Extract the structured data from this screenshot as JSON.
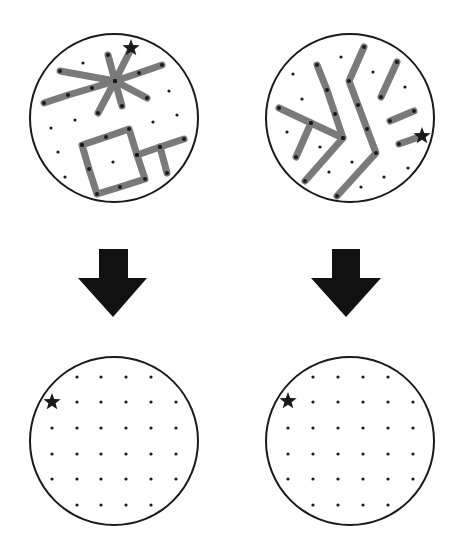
{
  "colors": {
    "outline": "#1a1a1a",
    "segment": "#7a7a7a",
    "dot": "#1a1a1a",
    "arrow": "#111111",
    "star": "#1a1a1a",
    "background": "#ffffff"
  },
  "panels": [
    {
      "id": "top-left",
      "circle": {
        "cx": 114,
        "cy": 118,
        "r": 84
      },
      "star": {
        "x": 131,
        "y": 48
      },
      "segments": [
        [
          [
            44,
            103
          ],
          [
            68,
            95
          ],
          [
            92,
            88
          ],
          [
            115,
            81
          ],
          [
            139,
            73
          ],
          [
            162,
            65
          ]
        ],
        [
          [
            60,
            71
          ],
          [
            115,
            81
          ],
          [
            147,
            98
          ]
        ],
        [
          [
            108,
            55
          ],
          [
            115,
            81
          ],
          [
            122,
            106
          ]
        ],
        [
          [
            131,
            49
          ],
          [
            115,
            81
          ],
          [
            98,
            113
          ]
        ],
        [
          [
            82,
            145
          ],
          [
            106,
            137
          ],
          [
            129,
            129
          ],
          [
            137,
            155
          ],
          [
            145,
            179
          ],
          [
            120,
            187
          ],
          [
            97,
            194
          ],
          [
            89,
            169
          ],
          [
            82,
            145
          ]
        ],
        [
          [
            137,
            155
          ],
          [
            160,
            147
          ],
          [
            184,
            139
          ]
        ],
        [
          [
            160,
            147
          ],
          [
            167,
            173
          ]
        ]
      ],
      "dots": [
        [
          83,
          63
        ],
        [
          169,
          91
        ],
        [
          75,
          120
        ],
        [
          51,
          128
        ],
        [
          153,
          122
        ],
        [
          177,
          115
        ],
        [
          58,
          152
        ],
        [
          65,
          177
        ],
        [
          113,
          162
        ]
      ]
    },
    {
      "id": "top-right",
      "circle": {
        "cx": 350,
        "cy": 118,
        "r": 84
      },
      "star": {
        "x": 422,
        "y": 136
      },
      "segments": [
        [
          [
            364,
            47
          ],
          [
            349,
            81
          ],
          [
            358,
            105
          ],
          [
            367,
            129
          ],
          [
            376,
            153
          ],
          [
            337,
            196
          ]
        ],
        [
          [
            317,
            65
          ],
          [
            327,
            90
          ],
          [
            335,
            114
          ],
          [
            343,
            138
          ],
          [
            305,
            181
          ]
        ],
        [
          [
            279,
            108
          ],
          [
            311,
            123
          ],
          [
            343,
            138
          ]
        ],
        [
          [
            311,
            123
          ],
          [
            296,
            157
          ]
        ],
        [
          [
            397,
            62
          ],
          [
            381,
            97
          ]
        ],
        [
          [
            414,
            111
          ],
          [
            390,
            121
          ]
        ],
        [
          [
            399,
            144
          ],
          [
            422,
            136
          ]
        ]
      ],
      "dots": [
        [
          341,
          57
        ],
        [
          293,
          74
        ],
        [
          373,
          72
        ],
        [
          405,
          87
        ],
        [
          302,
          99
        ],
        [
          287,
          132
        ],
        [
          320,
          147
        ],
        [
          352,
          162
        ],
        [
          329,
          172
        ],
        [
          408,
          168
        ],
        [
          384,
          177
        ],
        [
          361,
          187
        ]
      ]
    },
    {
      "id": "bottom-left",
      "circle": {
        "cx": 114,
        "cy": 441,
        "r": 84
      },
      "star": {
        "x": 52,
        "y": 402
      },
      "segments": [],
      "grid": {
        "cols": [
          52,
          77,
          101,
          126,
          151,
          176
        ],
        "rows": [
          377,
          402,
          428,
          454,
          479,
          505
        ],
        "row_cols": [
          [
            1,
            2,
            3,
            4
          ],
          [
            1,
            2,
            3,
            4,
            5
          ],
          [
            0,
            1,
            2,
            3,
            4,
            5
          ],
          [
            0,
            1,
            2,
            3,
            4,
            5
          ],
          [
            0,
            1,
            2,
            3,
            4,
            5
          ],
          [
            1,
            2,
            3,
            4
          ]
        ]
      }
    },
    {
      "id": "bottom-right",
      "circle": {
        "cx": 350,
        "cy": 441,
        "r": 84
      },
      "star": {
        "x": 288,
        "y": 401
      },
      "segments": [],
      "grid": {
        "cols": [
          288,
          313,
          338,
          363,
          388,
          413
        ],
        "rows": [
          377,
          402,
          428,
          454,
          479,
          505
        ],
        "row_cols": [
          [
            1,
            2,
            3,
            4
          ],
          [
            1,
            2,
            3,
            4,
            5
          ],
          [
            0,
            1,
            2,
            3,
            4,
            5
          ],
          [
            0,
            1,
            2,
            3,
            4,
            5
          ],
          [
            0,
            1,
            2,
            3,
            4,
            5
          ],
          [
            1,
            2,
            3,
            4
          ]
        ]
      }
    }
  ],
  "arrows": [
    {
      "id": "left",
      "stem": {
        "x1": 99,
        "x2": 128,
        "top": 249
      },
      "head": {
        "x1": 78,
        "x2": 147,
        "y": 278
      },
      "tip": {
        "x": 113,
        "y": 317
      }
    },
    {
      "id": "right",
      "stem": {
        "x1": 332,
        "x2": 360,
        "top": 249
      },
      "head": {
        "x1": 311,
        "x2": 381,
        "y": 278
      },
      "tip": {
        "x": 346,
        "y": 317
      }
    }
  ]
}
